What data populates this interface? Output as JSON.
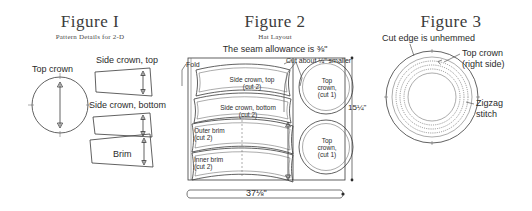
{
  "figure1": {
    "title": "Figure I",
    "subtitle": "Pattern Details for 2-D",
    "labels": {
      "top_crown": "Top crown",
      "side_crown_top": "Side crown, top",
      "side_crown_bottom": "Side crown, bottom",
      "brim": "Brim"
    }
  },
  "figure2": {
    "title": "Figure 2",
    "subtitle": "Hat Layout",
    "seam_note": "The seam allowance is ⅜\"",
    "fold_label": "Fold",
    "cut_note": "Cut about ¼\" smaller",
    "width_dim": "37⅛\"",
    "height_dim": "15¼\"",
    "pieces": [
      {
        "name": "Side crown, top",
        "qty": "(cut 2)"
      },
      {
        "name": "Side crown, bottom",
        "qty": "(cut 2)"
      },
      {
        "name": "Outer brim",
        "qty": "(cut 2)"
      },
      {
        "name": "Inner brim",
        "qty": "(cut 2)"
      }
    ],
    "circles": [
      {
        "name": "Top",
        "name2": "crown,",
        "qty": "(cut 1)"
      },
      {
        "name": "Top",
        "name2": "crown,",
        "qty": "(cut 1)"
      }
    ]
  },
  "figure3": {
    "title": "Figure 3",
    "cut_edge_note": "Cut edge is unhemmed",
    "top_crown_label": "Top crown",
    "top_crown_label2": "(right side)",
    "zigzag_label": "Zigzag",
    "zigzag_label2": "stitch"
  },
  "colors": {
    "ink": "#231f20",
    "line": "#3a3a3a",
    "paper": "#ffffff"
  }
}
